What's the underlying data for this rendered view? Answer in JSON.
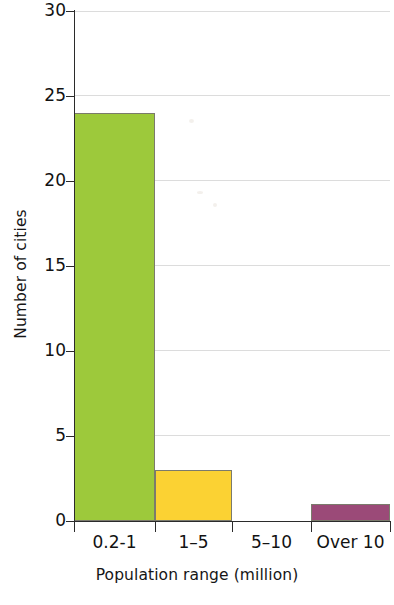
{
  "chart_data": {
    "type": "bar",
    "title": "",
    "subtitle": "",
    "xlabel": "Population range (million)",
    "ylabel": "Number of cities",
    "categories": [
      "0.2-1",
      "1–5",
      "5–10",
      "Over 10"
    ],
    "values": [
      24,
      3,
      0,
      1
    ],
    "series": [
      {
        "name": "Number of cities",
        "values": [
          24,
          3,
          0,
          1
        ]
      }
    ],
    "bar_colors": [
      "#9dc93b",
      "#fbd233",
      "#ffffff",
      "#9b4a78"
    ],
    "ylim": [
      0,
      30
    ],
    "yticks": [
      0,
      5,
      10,
      15,
      20,
      25,
      30
    ],
    "ytick_labels": [
      "0",
      "5",
      "10",
      "15",
      "20",
      "25",
      "30"
    ],
    "xlim": [
      0,
      4
    ],
    "grid": "horizontal",
    "grid_color": "#dcdcdc",
    "legend": "none",
    "axis_color": "#2b2b2b",
    "background": "#ffffff"
  },
  "axes": {
    "y_title": "Number of cities",
    "x_title": "Population range (million)"
  },
  "colors": {
    "green": "#9dc93b",
    "yellow": "#fbd233",
    "purple": "#9b4a78",
    "axis": "#2b2b2b",
    "grid": "#dcdcdc",
    "text": "#121212"
  }
}
